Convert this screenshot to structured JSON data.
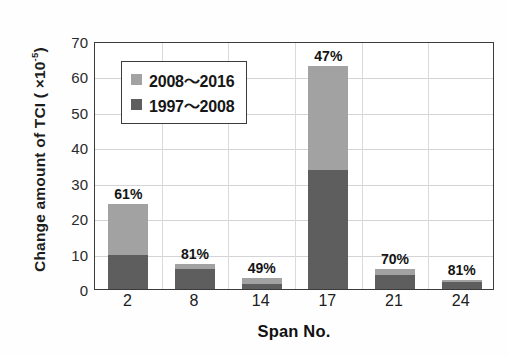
{
  "chart_data": {
    "type": "bar",
    "stacked": true,
    "title": "",
    "xlabel": "Span No.",
    "ylabel": "Change amount of TCI ( ×10-5)",
    "ylabel_prefix": "Change amount of TCI ( ×10",
    "ylabel_exponent": "-5",
    "ylabel_suffix": ")",
    "categories": [
      "2",
      "8",
      "14",
      "17",
      "21",
      "24"
    ],
    "series": [
      {
        "name": "1997〜2008",
        "color": "#5e5e5e",
        "values": [
          9.6,
          5.7,
          1.5,
          33.5,
          3.9,
          2.0
        ]
      },
      {
        "name": "2008〜2016",
        "color": "#a2a2a2",
        "values": [
          14.4,
          1.3,
          1.5,
          29.5,
          1.7,
          0.5
        ]
      }
    ],
    "totals": [
      24.0,
      7.0,
      3.0,
      63.0,
      5.6,
      2.5
    ],
    "annotations": [
      "61%",
      "81%",
      "49%",
      "47%",
      "70%",
      "81%"
    ],
    "ylim": [
      0,
      70
    ],
    "yticks": [
      0,
      10,
      20,
      30,
      40,
      50,
      60,
      70
    ],
    "ytick_labels": [
      "0",
      "10",
      "20",
      "30",
      "40",
      "50",
      "60",
      "70"
    ],
    "grid": true,
    "legend_position": "upper-left",
    "legend": [
      {
        "label": "2008〜2016",
        "color": "#a2a2a2"
      },
      {
        "label": "1997〜2008",
        "color": "#5e5e5e"
      }
    ],
    "colors": {
      "series_light": "#a2a2a2",
      "series_dark": "#5e5e5e",
      "axis": "#3b3b3b",
      "grid": "#d3d3d8",
      "text": "#141414",
      "background": "#ffffff"
    }
  }
}
